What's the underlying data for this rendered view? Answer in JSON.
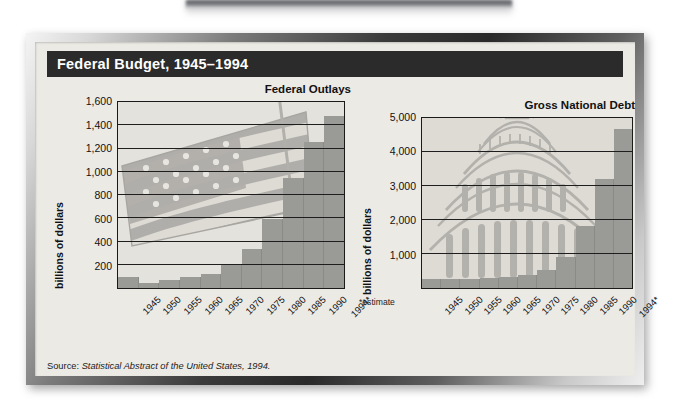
{
  "header": {
    "title": "Federal Budget, 1945–1994"
  },
  "source": {
    "prefix": "Source:",
    "citation": "Statistical Abstract of the United States, 1994."
  },
  "footnote": {
    "estimate": "*estimate"
  },
  "colors": {
    "title_bar": "#2b2b2b",
    "panel_bg": "#eceae5",
    "plot_bg": "#e4e2dd",
    "bar": "#9a9a97",
    "axis": "#1a1a1a",
    "text": "#111111"
  },
  "chart_data": [
    {
      "type": "bar",
      "id": "federal-outlays",
      "title": "Federal Outlays",
      "ylabel": "billions of dollars",
      "xlabel": "",
      "ylim": [
        0,
        1600
      ],
      "yticks": [
        200,
        400,
        600,
        800,
        1000,
        1200,
        1400,
        1600
      ],
      "ytick_labels": [
        "200",
        "400",
        "600",
        "800",
        "1,000",
        "1,200",
        "1,400",
        "1,600"
      ],
      "grid": true,
      "legend": "none",
      "categories": [
        "1945",
        "1950",
        "1955",
        "1960",
        "1965",
        "1970",
        "1975",
        "1980",
        "1985",
        "1990",
        "1994*"
      ],
      "values": [
        93,
        43,
        68,
        92,
        118,
        196,
        332,
        591,
        946,
        1253,
        1484
      ],
      "watermark": "american-flag"
    },
    {
      "type": "bar",
      "id": "gross-national-debt",
      "title": "Gross National Debt",
      "ylabel": "billions of dollars",
      "xlabel": "",
      "ylim": [
        0,
        5000
      ],
      "yticks": [
        1000,
        2000,
        3000,
        4000,
        5000
      ],
      "ytick_labels": [
        "1,000",
        "2,000",
        "3,000",
        "4,000",
        "5,000"
      ],
      "grid": true,
      "legend": "none",
      "categories": [
        "1945",
        "1950",
        "1955",
        "1960",
        "1965",
        "1970",
        "1975",
        "1980",
        "1985",
        "1990",
        "1994*"
      ],
      "values": [
        260,
        257,
        274,
        291,
        323,
        381,
        542,
        909,
        1818,
        3207,
        4676
      ],
      "watermark": "us-capitol-dome"
    }
  ]
}
